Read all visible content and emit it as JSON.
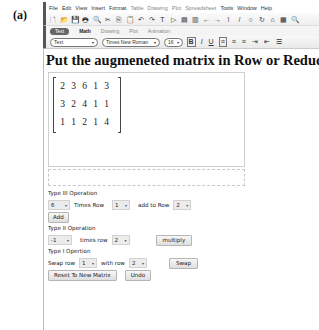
{
  "figure_label": "(a)",
  "menu": {
    "items": [
      {
        "label": "File",
        "enabled": true
      },
      {
        "label": "Edit",
        "enabled": true
      },
      {
        "label": "View",
        "enabled": true
      },
      {
        "label": "Insert",
        "enabled": true
      },
      {
        "label": "Format",
        "enabled": true
      },
      {
        "label": "Table",
        "enabled": false
      },
      {
        "label": "Drawing",
        "enabled": false
      },
      {
        "label": "Plot",
        "enabled": false
      },
      {
        "label": "Spreadsheet",
        "enabled": false
      },
      {
        "label": "Tools",
        "enabled": true
      },
      {
        "label": "Window",
        "enabled": true
      },
      {
        "label": "Help",
        "enabled": true
      }
    ]
  },
  "toolbar": {
    "icons": [
      {
        "name": "new-document-icon",
        "glyph": "🗋"
      },
      {
        "name": "open-icon",
        "glyph": "📂"
      },
      {
        "name": "save-icon",
        "glyph": "💾"
      },
      {
        "name": "print-icon",
        "glyph": "🖶"
      },
      {
        "name": "print-preview-icon",
        "glyph": "🔍"
      },
      {
        "name": "cut-icon",
        "glyph": "✂"
      },
      {
        "name": "copy-icon",
        "glyph": "⎘"
      },
      {
        "name": "paste-icon",
        "glyph": "📋"
      },
      {
        "name": "undo-icon",
        "glyph": "↶"
      },
      {
        "name": "redo-icon",
        "glyph": "↷"
      },
      {
        "name": "text-mode-icon",
        "glyph": "T"
      },
      {
        "name": "math-mode-icon",
        "glyph": "▷"
      },
      {
        "name": "execute-group-icon",
        "glyph": "▤"
      },
      {
        "name": "execute-all-icon",
        "glyph": "▥"
      },
      {
        "name": "back-icon",
        "glyph": "←"
      },
      {
        "name": "forward-icon",
        "glyph": "→"
      },
      {
        "name": "execute-icon",
        "glyph": "!"
      },
      {
        "name": "debug-icon",
        "glyph": "/"
      },
      {
        "name": "stop-icon",
        "glyph": "○"
      },
      {
        "name": "restart-icon",
        "glyph": "↻"
      },
      {
        "name": "help-icon",
        "glyph": "⌂"
      },
      {
        "name": "grid-icon",
        "glyph": "▦"
      },
      {
        "name": "zoom-icon",
        "glyph": "🔍"
      }
    ]
  },
  "tabs": [
    {
      "label": "Text",
      "active": true
    },
    {
      "label": "Math",
      "active": false
    },
    {
      "label": "Drawing",
      "active": false
    },
    {
      "label": "Plot",
      "active": false
    },
    {
      "label": "Animation",
      "active": false
    }
  ],
  "formatbar": {
    "style_value": "Text",
    "font_value": "Times New Roman",
    "size_value": "16",
    "bold": "B",
    "italic": "I",
    "underline": "U",
    "align_left": "≡",
    "align_center": "≡",
    "align_right": "≡",
    "indent": "⇥",
    "outdent": "⇤",
    "bullets": "☰"
  },
  "heading": "Put the augmeneted matrix in Row or Reduced Row",
  "matrix": {
    "rows": [
      [
        "2",
        "3",
        "6",
        "1",
        "3"
      ],
      [
        "3",
        "2",
        "4",
        "1",
        "1"
      ],
      [
        "1",
        "1",
        "2",
        "1",
        "4"
      ]
    ]
  },
  "type3": {
    "title": "Type III Operation",
    "multiplier": "6",
    "times_row_label": "Times Row",
    "source_row": "1",
    "add_to_row_label": "add to Row",
    "target_row": "2",
    "button": "Add"
  },
  "type2": {
    "title": "Type II Operation",
    "multiplier": "-1",
    "times_row_label": "times row",
    "row": "2",
    "button": "multiply"
  },
  "type1": {
    "title": "Type I Opertion",
    "swap_row_label": "Swap row",
    "row_a": "1",
    "with_row_label": "with row",
    "row_b": "2",
    "button": "Swap"
  },
  "actions": {
    "reset": "Reset To New Matrix",
    "undo": "Undo"
  },
  "dropdown_arrow": "▾"
}
